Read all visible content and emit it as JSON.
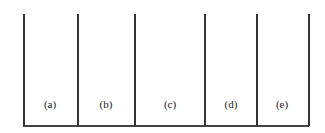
{
  "diagram": {
    "dividers_x": [
      23,
      77,
      134,
      204,
      256,
      308
    ],
    "top_y": 14,
    "baseline_y": 125,
    "line_color": "#333333",
    "panels": [
      {
        "label": "(a)",
        "center_x": 50
      },
      {
        "label": "(b)",
        "center_x": 106
      },
      {
        "label": "(c)",
        "center_x": 170
      },
      {
        "label": "(d)",
        "center_x": 231
      },
      {
        "label": "(e)",
        "center_x": 282
      }
    ]
  }
}
